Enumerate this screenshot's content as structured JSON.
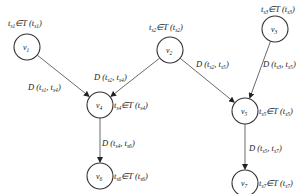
{
  "diagram": {
    "type": "directed-graph",
    "nodes": [
      {
        "id": "v1",
        "label": "v",
        "sub": "1",
        "x": 27,
        "y": 47,
        "constraint": {
          "pre": "t",
          "pre_sub": "s1",
          "mid": "∈T (",
          "arg": "t",
          "arg_sub": "s1",
          "post": ")"
        },
        "constraint_pos": {
          "x": 8,
          "y": 26
        }
      },
      {
        "id": "v2",
        "label": "v",
        "sub": "2",
        "x": 170,
        "y": 50,
        "constraint": {
          "pre": "t",
          "pre_sub": "s2",
          "mid": "∈T (",
          "arg": "t",
          "arg_sub": "s2",
          "post": ")"
        },
        "constraint_pos": {
          "x": 149,
          "y": 30
        }
      },
      {
        "id": "v3",
        "label": "v",
        "sub": "3",
        "x": 275,
        "y": 29,
        "constraint": {
          "pre": "t",
          "pre_sub": "s3",
          "mid": "∈T (",
          "arg": "t",
          "arg_sub": "s3",
          "post": ")"
        },
        "constraint_pos": {
          "x": 261,
          "y": 12
        }
      },
      {
        "id": "v4",
        "label": "v",
        "sub": "4",
        "x": 100,
        "y": 105,
        "constraint": {
          "pre": "t",
          "pre_sub": "s4",
          "mid": "∈T (",
          "arg": "t",
          "arg_sub": "s4",
          "post": ")"
        },
        "constraint_pos": {
          "x": 114,
          "y": 108
        }
      },
      {
        "id": "v5",
        "label": "v",
        "sub": "5",
        "x": 245,
        "y": 111,
        "constraint": {
          "pre": "t",
          "pre_sub": "s5",
          "mid": "∈T (",
          "arg": "t",
          "arg_sub": "s5",
          "post": ")"
        },
        "constraint_pos": {
          "x": 259,
          "y": 114
        }
      },
      {
        "id": "v6",
        "label": "v",
        "sub": "6",
        "x": 100,
        "y": 176,
        "constraint": {
          "pre": "t",
          "pre_sub": "s6",
          "mid": "∈T (",
          "arg": "t",
          "arg_sub": "s6",
          "post": ")"
        },
        "constraint_pos": {
          "x": 114,
          "y": 179
        }
      },
      {
        "id": "v7",
        "label": "v",
        "sub": "7",
        "x": 245,
        "y": 183,
        "constraint": {
          "pre": "t",
          "pre_sub": "s7",
          "mid": "∈T (",
          "arg": "t",
          "arg_sub": "s7",
          "post": ")"
        },
        "constraint_pos": {
          "x": 259,
          "y": 186
        }
      }
    ],
    "edges": [
      {
        "from": "v1",
        "to": "v4",
        "label": {
          "a": "s1",
          "b": "s4"
        },
        "label_pos": {
          "x": 28,
          "y": 90
        }
      },
      {
        "from": "v2",
        "to": "v4",
        "label": {
          "a": "s2",
          "b": "s4"
        },
        "label_pos": {
          "x": 94,
          "y": 80
        }
      },
      {
        "from": "v2",
        "to": "v5",
        "label": {
          "a": "s2",
          "b": "s5"
        },
        "label_pos": {
          "x": 196,
          "y": 67
        }
      },
      {
        "from": "v3",
        "to": "v5",
        "label": {
          "a": "s3",
          "b": "s5"
        },
        "label_pos": {
          "x": 263,
          "y": 67
        }
      },
      {
        "from": "v4",
        "to": "v6",
        "label": {
          "a": "s4",
          "b": "s6"
        },
        "label_pos": {
          "x": 102,
          "y": 146
        }
      },
      {
        "from": "v5",
        "to": "v7",
        "label": {
          "a": "s5",
          "b": "s7"
        },
        "label_pos": {
          "x": 249,
          "y": 151
        }
      }
    ],
    "edge_label_format": "D (t_a, t_b)",
    "node_label_format": "t_s ∈ T (t_s)"
  }
}
